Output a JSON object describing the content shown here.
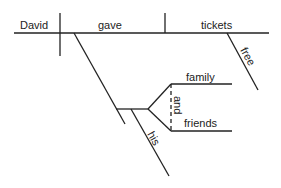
{
  "diagram": {
    "type": "sentence-diagram",
    "subject": "David",
    "verb": "gave",
    "direct_object": "tickets",
    "object_modifier": "free",
    "conjunction": "and",
    "compound_objects": [
      "family",
      "friends"
    ],
    "possessive_modifier": "his"
  }
}
